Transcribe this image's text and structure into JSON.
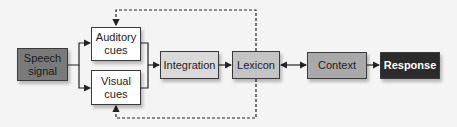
{
  "diagram": {
    "nodes": [
      {
        "id": "speech",
        "label": "Speech signal",
        "line1": "Speech",
        "line2": "signal",
        "fill": "#7a7a7a"
      },
      {
        "id": "auditory",
        "label": "Auditory cues",
        "line1": "Auditory",
        "line2": "cues",
        "fill": "#ffffff"
      },
      {
        "id": "visual",
        "label": "Visual cues",
        "line1": "Visual",
        "line2": "cues",
        "fill": "#ffffff"
      },
      {
        "id": "integration",
        "label": "Integration",
        "fill": "#d9d9d9"
      },
      {
        "id": "lexicon",
        "label": "Lexicon",
        "fill": "#c4c4c4"
      },
      {
        "id": "context",
        "label": "Context",
        "fill": "#a9a9a9"
      },
      {
        "id": "response",
        "label": "Response",
        "fill": "#2b2b2b"
      }
    ],
    "edges": [
      {
        "from": "speech",
        "to": "auditory",
        "style": "solid"
      },
      {
        "from": "speech",
        "to": "visual",
        "style": "solid"
      },
      {
        "from": "auditory",
        "to": "integration",
        "style": "solid"
      },
      {
        "from": "visual",
        "to": "integration",
        "style": "solid"
      },
      {
        "from": "integration",
        "to": "lexicon",
        "style": "solid"
      },
      {
        "from": "lexicon",
        "to": "context",
        "style": "solid",
        "bidirectional": true
      },
      {
        "from": "context",
        "to": "response",
        "style": "solid"
      },
      {
        "from": "lexicon",
        "to": "auditory",
        "style": "dashed",
        "label": "feedback"
      },
      {
        "from": "lexicon",
        "to": "visual",
        "style": "dashed",
        "label": "feedback"
      }
    ]
  }
}
